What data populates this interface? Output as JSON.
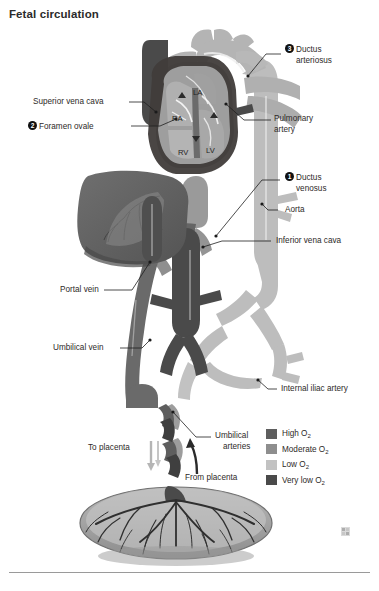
{
  "page": {
    "title": "Fetal circulation",
    "watermark_icon": "small-square-mark"
  },
  "callouts": [
    {
      "number": "1",
      "label_line1": "Ductus",
      "label_line2": "venosus"
    },
    {
      "number": "2",
      "label": "Foramen ovale"
    },
    {
      "number": "3",
      "label_line1": "Ductus",
      "label_line2": "arteriosus"
    }
  ],
  "labels": {
    "superior_vena_cava": "Superior vena cava",
    "pulmonary_artery_line1": "Pulmonary",
    "pulmonary_artery_line2": "artery",
    "aorta": "Aorta",
    "inferior_vena_cava": "Inferior vena cava",
    "portal_vein": "Portal vein",
    "umbilical_vein": "Umbilical vein",
    "internal_iliac_artery": "Internal iliac artery",
    "umbilical_arteries_line1": "Umbilical",
    "umbilical_arteries_line2": "arteries",
    "to_placenta": "To placenta",
    "from_placenta": "From placenta"
  },
  "heart_chambers": {
    "la": "LA",
    "ra": "RA",
    "rv": "RV",
    "lv": "LV"
  },
  "legend": {
    "items": [
      {
        "label": "High O",
        "sub": "2",
        "color": "#5e5e5e"
      },
      {
        "label": "Moderate O",
        "sub": "2",
        "color": "#8e8e8e"
      },
      {
        "label": "Low O",
        "sub": "2",
        "color": "#c2c2c2"
      },
      {
        "label": "Very low O",
        "sub": "2",
        "color": "#4a4a4a"
      }
    ]
  },
  "colors": {
    "high_o2": "#5e5e5e",
    "moderate_o2": "#8e8e8e",
    "low_o2": "#c2c2c2",
    "very_low_o2": "#4a4a4a",
    "outline": "#3a3634",
    "leader_line": "#2b2b2b",
    "rule": "#9a9a9a"
  }
}
